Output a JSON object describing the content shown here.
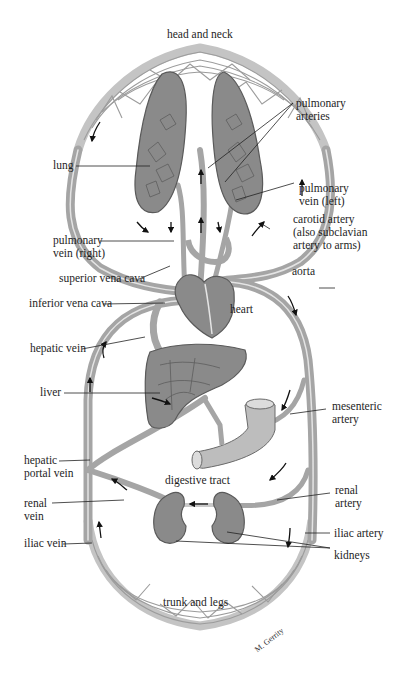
{
  "figure": {
    "colors": {
      "background": "#ffffff",
      "vessel_fill": "#a9a9a9",
      "vessel_highlight": "#e6e6e6",
      "organ_fill": "#8e8e8e",
      "organ_outline": "#5a5a5a",
      "capillary_bed": "#c8c8c8",
      "leader_line": "#222222",
      "text": "#1e1e1e"
    },
    "regions": {
      "top": "head and neck",
      "bottom": "trunk and legs",
      "middle": "digestive tract"
    },
    "labels_left": [
      {
        "id": "lung",
        "text": "lung"
      },
      {
        "id": "pulmonary-vein-right",
        "line1": "pulmonary",
        "line2": "vein (right)"
      },
      {
        "id": "superior-vena-cava",
        "text": "superior vena cava"
      },
      {
        "id": "inferior-vena-cava",
        "text": "inferior vena cava"
      },
      {
        "id": "hepatic-vein",
        "text": "hepatic vein"
      },
      {
        "id": "liver",
        "text": "liver"
      },
      {
        "id": "hepatic-portal-vein",
        "line1": "hepatic",
        "line2": "portal vein"
      },
      {
        "id": "renal-vein",
        "line1": "renal",
        "line2": "vein"
      },
      {
        "id": "iliac-vein",
        "text": "iliac vein"
      }
    ],
    "labels_right": [
      {
        "id": "pulmonary-arteries",
        "line1": "pulmonary",
        "line2": "arteries"
      },
      {
        "id": "pulmonary-vein-left",
        "line1": "pulmonary",
        "line2": "vein (left)"
      },
      {
        "id": "carotid-artery",
        "line1": "carotid artery",
        "line2": "(also subclavian",
        "line3": "artery to arms)"
      },
      {
        "id": "aorta",
        "text": "aorta"
      },
      {
        "id": "heart",
        "text": "heart"
      },
      {
        "id": "mesenteric-artery",
        "line1": "mesenteric",
        "line2": "artery"
      },
      {
        "id": "renal-artery",
        "line1": "renal",
        "line2": "artery"
      },
      {
        "id": "iliac-artery",
        "text": "iliac artery"
      },
      {
        "id": "kidneys",
        "text": "kidneys"
      }
    ],
    "signature": "M. Gerrity"
  }
}
